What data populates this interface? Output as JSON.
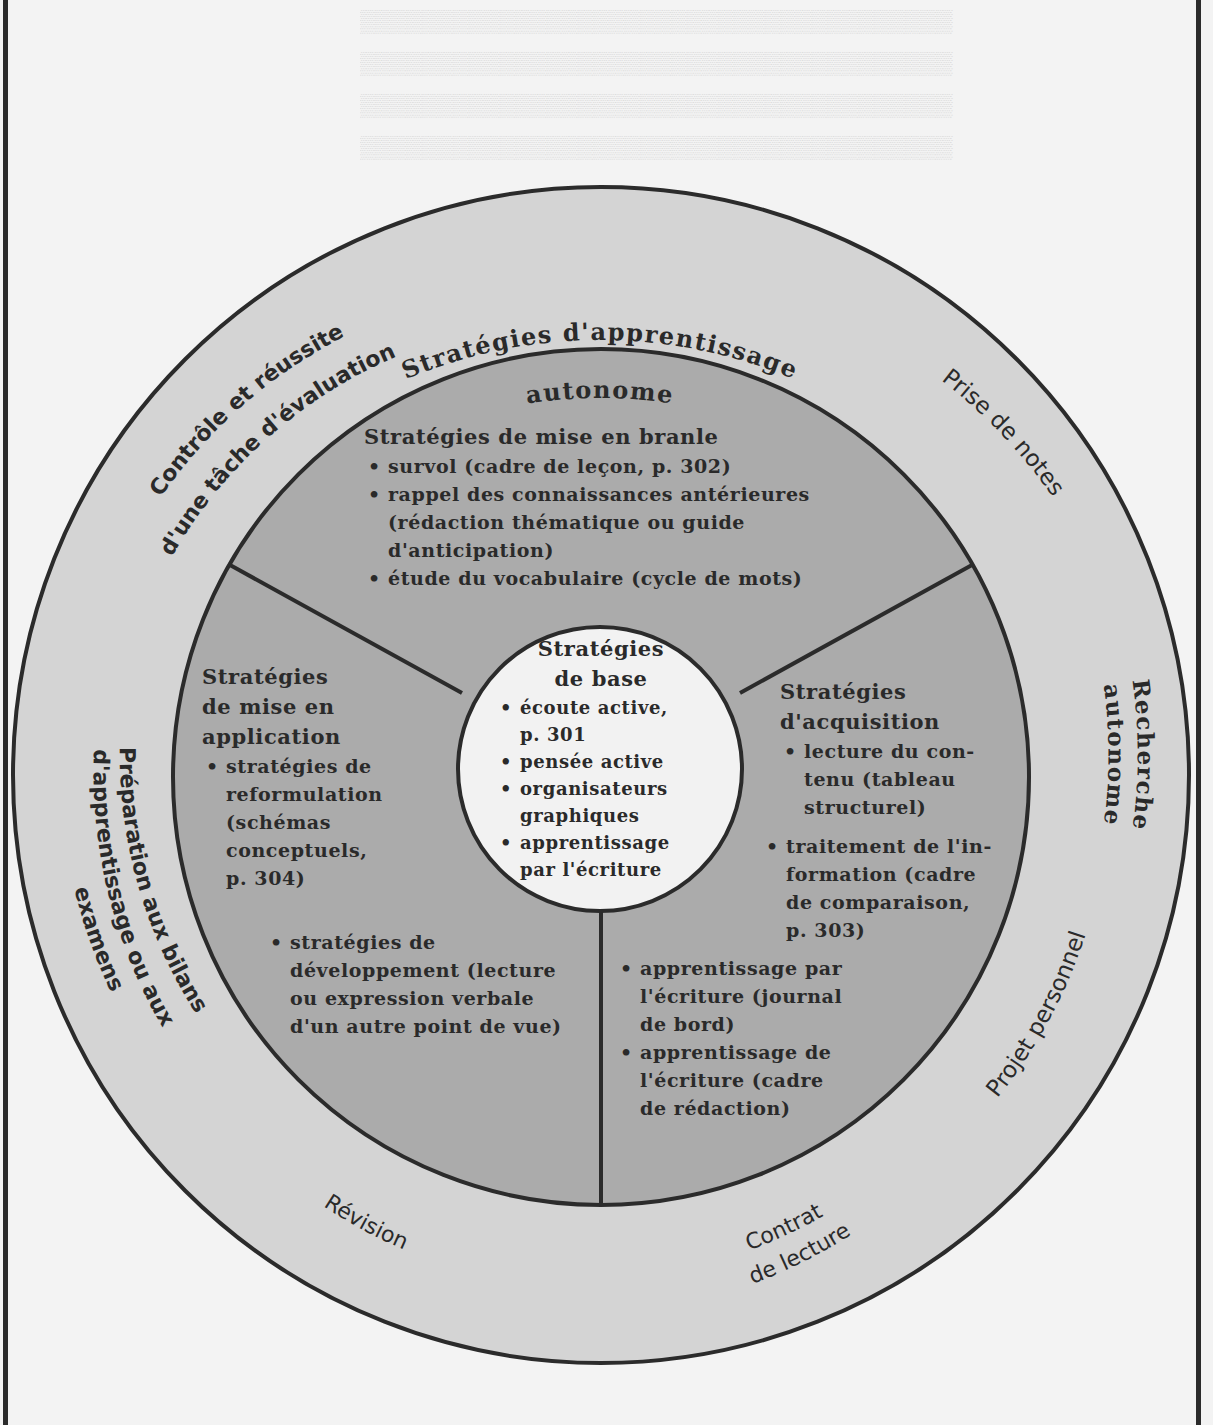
{
  "diagram": {
    "colors": {
      "page_background": "#f3f3f3",
      "outer_ring": "#d4d4d4",
      "middle_ring": "#ababab",
      "center_circle": "#f2f2f2",
      "stroke": "#2b2b2b",
      "text": "#2a2a2a"
    },
    "outer_ring_labels": {
      "top": [
        "Stratégies d'apprentissage",
        "autonome"
      ],
      "prise_de_notes": "Prise de notes",
      "recherche_autonome": [
        "Recherche",
        "autonome"
      ],
      "projet_personnel": "Projet personnel",
      "contrat_de_lecture": [
        "Contrat",
        "de lecture"
      ],
      "revision": "Révision",
      "preparation": [
        "Préparation aux bilans",
        "d'apprentissage ou aux",
        "examens"
      ],
      "controle": [
        "Contrôle et réussite",
        "d'une tâche d'évaluation"
      ]
    },
    "mise_en_branle": {
      "title": "Stratégies de mise en branle",
      "items": [
        [
          "survol (cadre de leçon, p. 302)"
        ],
        [
          "rappel des connaissances antérieures",
          "(rédaction thématique ou guide",
          "d'anticipation)"
        ],
        [
          "étude du vocabulaire (cycle de mots)"
        ]
      ]
    },
    "mise_en_application": {
      "title": [
        "Stratégies",
        "de mise en",
        "application"
      ],
      "items": [
        [
          "stratégies de",
          "reformulation",
          "(schémas",
          "conceptuels,",
          "p. 304)"
        ],
        [
          "stratégies de",
          "développement (lecture",
          "ou expression verbale",
          "d'un autre point de vue)"
        ]
      ]
    },
    "acquisition": {
      "title": [
        "Stratégies",
        "d'acquisition"
      ],
      "items": [
        [
          "lecture du con-",
          "tenu (tableau",
          "structurel)"
        ],
        [
          "traitement de l'in-",
          "formation (cadre",
          "de comparaison,",
          "p. 303)"
        ],
        [
          "apprentissage par",
          "l'écriture (journal",
          "de bord)"
        ],
        [
          "apprentissage de",
          "l'écriture (cadre",
          "de rédaction)"
        ]
      ]
    },
    "base": {
      "title": [
        "Stratégies",
        "de base"
      ],
      "items": [
        [
          "écoute active,",
          "p. 301"
        ],
        [
          "pensée active"
        ],
        [
          "organisateurs",
          "graphiques"
        ],
        [
          "apprentissage",
          "par l'écriture"
        ]
      ]
    }
  }
}
